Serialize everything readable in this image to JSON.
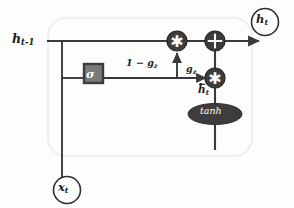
{
  "diagram": {
    "type": "gru-minimal-gated-unit-cell",
    "colors": {
      "line": "#3a3a3a",
      "node_fill": "#3d3d3d",
      "sigma_fill": "#7a7a7a",
      "sigma_border": "#3d3d3d",
      "cell_border": "#f1f1f1",
      "text": "#1d1d1d",
      "background": "#fdfdfd"
    },
    "inputs": [
      {
        "name": "hidden-state-previous",
        "label_h": "h",
        "label_sub": "t-1",
        "style": "plain-text"
      },
      {
        "name": "input-x",
        "label_h": "x",
        "label_sub": "t",
        "style": "circle-node"
      }
    ],
    "outputs": [
      {
        "name": "hidden-state-current",
        "label_h": "h",
        "label_sub": "t",
        "style": "circle-node"
      }
    ],
    "nodes": [
      {
        "name": "sigma-gate",
        "glyph": "σ",
        "shape": "square",
        "label": "sigma"
      },
      {
        "name": "multiply-top",
        "glyph": "✳",
        "shape": "circle",
        "label": "multiply"
      },
      {
        "name": "add",
        "glyph": "+",
        "shape": "circle",
        "label": "add"
      },
      {
        "name": "multiply-bottom",
        "glyph": "✳",
        "shape": "circle",
        "label": "multiply"
      },
      {
        "name": "tanh-activation",
        "glyph": "tanh",
        "shape": "ellipse",
        "label": "tanh"
      }
    ],
    "edge_labels": {
      "one_minus_gate": "1 − g",
      "one_minus_gate_sub": "z",
      "gate": "g",
      "gate_sub": "z",
      "candidate_h": "h",
      "candidate_h_sub": "t"
    }
  }
}
